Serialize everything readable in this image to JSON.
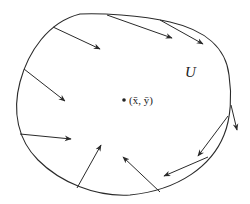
{
  "diagram": {
    "region_label": "U",
    "point_label": "(x̄, ȳ)",
    "stroke_color": "#2a2a2a",
    "background": "#ffffff",
    "boundary": "closed smooth curve enclosing region U",
    "arrows": [
      {
        "from": [
          53,
          27
        ],
        "to": [
          100,
          49
        ]
      },
      {
        "from": [
          24,
          69
        ],
        "to": [
          65,
          101
        ]
      },
      {
        "from": [
          20,
          134
        ],
        "to": [
          71,
          139
        ]
      },
      {
        "from": [
          77,
          188
        ],
        "to": [
          101,
          145
        ]
      },
      {
        "from": [
          160,
          192
        ],
        "to": [
          123,
          157
        ]
      },
      {
        "from": [
          208,
          157
        ],
        "to": [
          164,
          176
        ]
      },
      {
        "from": [
          228,
          116
        ],
        "to": [
          198,
          156
        ]
      },
      {
        "from": [
          231,
          105
        ],
        "to": [
          237,
          130
        ]
      },
      {
        "from": [
          160,
          20
        ],
        "to": [
          203,
          44
        ]
      },
      {
        "from": [
          107,
          15
        ],
        "to": [
          172,
          38
        ]
      }
    ]
  }
}
